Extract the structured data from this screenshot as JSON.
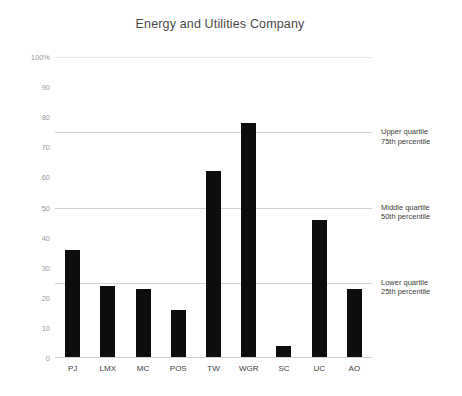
{
  "chart_data": {
    "type": "bar",
    "title": "Energy and Utilities Company",
    "xlabel": "",
    "ylabel": "",
    "categories": [
      "PJ",
      "LMX",
      "MC",
      "POS",
      "TW",
      "WGR",
      "SC",
      "UC",
      "AO"
    ],
    "values": [
      36,
      24,
      23,
      16,
      62,
      78,
      4,
      46,
      23
    ],
    "ylim": [
      0,
      100
    ],
    "yticks": [
      0,
      10,
      20,
      30,
      40,
      50,
      60,
      70,
      80,
      90,
      100
    ],
    "ytick_labels": [
      "0",
      "10",
      "20",
      "30",
      "40",
      "50",
      "60",
      "70",
      "80",
      "90",
      "100%"
    ],
    "grid": true,
    "gridlines": [
      100,
      75,
      50,
      25
    ],
    "legend": null,
    "bar_color": "#0d0d0d",
    "gridline_color": "#d2d2d2",
    "annotations": [
      {
        "value": 75,
        "line1": "Upper quartile",
        "line2": "75th percentile"
      },
      {
        "value": 50,
        "line1": "Middle quartile",
        "line2": "50th percentile"
      },
      {
        "value": 25,
        "line1": "Lower quartile",
        "line2": "25th percentile"
      }
    ]
  }
}
